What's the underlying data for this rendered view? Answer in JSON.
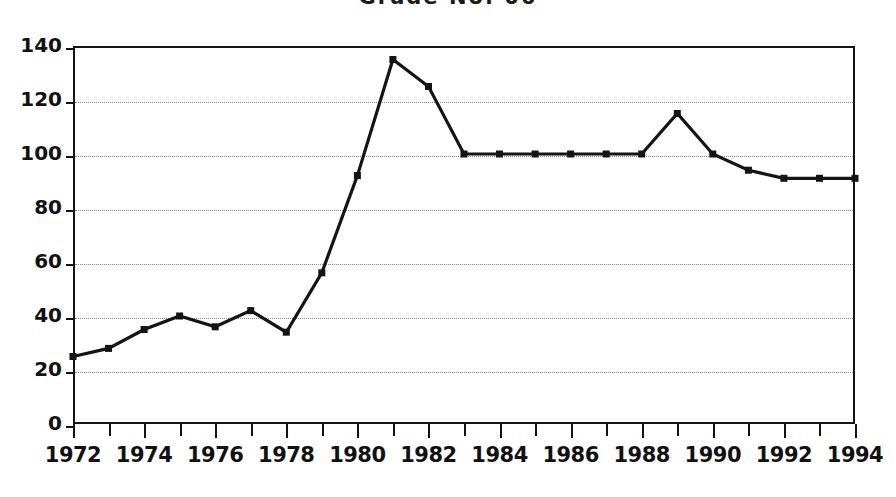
{
  "chart_data": {
    "type": "line",
    "title": "Grade No. 06",
    "xlabel": "",
    "ylabel": "",
    "xlim": [
      1972,
      1994
    ],
    "ylim": [
      0,
      140
    ],
    "grid": true,
    "legend": "none",
    "marker": "square",
    "line_color": "#141414",
    "marker_color": "#141414",
    "x": [
      1972,
      1973,
      1974,
      1975,
      1976,
      1977,
      1978,
      1979,
      1980,
      1981,
      1982,
      1983,
      1984,
      1985,
      1986,
      1987,
      1988,
      1989,
      1990,
      1991,
      1992,
      1993,
      1994
    ],
    "values": [
      25,
      28,
      35,
      40,
      36,
      42,
      34,
      56,
      92,
      135,
      125,
      100,
      100,
      100,
      100,
      100,
      100,
      115,
      100,
      94,
      91,
      91,
      91
    ],
    "ytick_labels": [
      "0",
      "20",
      "40",
      "60",
      "80",
      "100",
      "120",
      "140"
    ],
    "ytick_values": [
      0,
      20,
      40,
      60,
      80,
      100,
      120,
      140
    ],
    "xtick_labels": [
      "1972",
      "1974",
      "1976",
      "1978",
      "1980",
      "1982",
      "1984",
      "1986",
      "1988",
      "1990",
      "1992",
      "1994"
    ],
    "xtick_values": [
      1972,
      1974,
      1976,
      1978,
      1980,
      1982,
      1984,
      1986,
      1988,
      1990,
      1992,
      1994
    ],
    "xtick_minor_values": [
      1973,
      1975,
      1977,
      1979,
      1981,
      1983,
      1985,
      1987,
      1989,
      1991,
      1993
    ],
    "annotations": []
  }
}
